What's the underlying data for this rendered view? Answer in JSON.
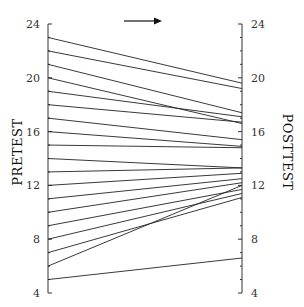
{
  "chart_data": {
    "type": "line",
    "subtype": "slope",
    "title": "",
    "left_axis_label": "PRETEST",
    "right_axis_label": "POSTTEST",
    "direction_arrow": "right",
    "ylim": [
      4,
      24
    ],
    "major_ticks": [
      4,
      8,
      12,
      16,
      20,
      24
    ],
    "minor_tick_step": 1,
    "grid": false,
    "legend": null,
    "series": [
      {
        "pretest": 23,
        "posttest": 19.6
      },
      {
        "pretest": 22,
        "posttest": 19.2
      },
      {
        "pretest": 21,
        "posttest": 17.4
      },
      {
        "pretest": 20,
        "posttest": 16.6
      },
      {
        "pretest": 19,
        "posttest": 17.1
      },
      {
        "pretest": 18,
        "posttest": 16.7
      },
      {
        "pretest": 17,
        "posttest": 15.4
      },
      {
        "pretest": 16,
        "posttest": 14.9
      },
      {
        "pretest": 15,
        "posttest": 14.8
      },
      {
        "pretest": 14,
        "posttest": 13.3
      },
      {
        "pretest": 13,
        "posttest": 13.3
      },
      {
        "pretest": 12,
        "posttest": 12.9
      },
      {
        "pretest": 11,
        "posttest": 12.5
      },
      {
        "pretest": 10,
        "posttest": 12.2
      },
      {
        "pretest": 9,
        "posttest": 11.7
      },
      {
        "pretest": 8,
        "posttest": 11.4
      },
      {
        "pretest": 7,
        "posttest": 11.1
      },
      {
        "pretest": 6,
        "posttest": 12.0
      },
      {
        "pretest": 5,
        "posttest": 6.6
      }
    ]
  },
  "labels": {
    "left_ticks": [
      "24",
      "20",
      "16",
      "12",
      "8",
      "4"
    ],
    "right_ticks": [
      "24",
      "20",
      "16",
      "12",
      "8",
      "4"
    ],
    "left_title": "PRETEST",
    "right_title": "POSTTEST"
  },
  "colors": {
    "line": "#222222",
    "axis": "#333333",
    "text": "#333333",
    "background": "#ffffff"
  }
}
